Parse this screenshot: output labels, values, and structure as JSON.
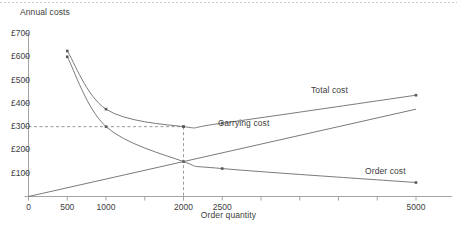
{
  "chart_data": {
    "type": "line",
    "title": "",
    "xlabel": "Order quantity",
    "ylabel": "Annual costs",
    "xlim": [
      0,
      5200
    ],
    "ylim": [
      0,
      700
    ],
    "grid": false,
    "legend_position": "inline-annotations",
    "x_ticks": [
      {
        "value": 0,
        "label": "0"
      },
      {
        "value": 500,
        "label": "500"
      },
      {
        "value": 1000,
        "label": "1000"
      },
      {
        "value": 1500,
        "label": ""
      },
      {
        "value": 2000,
        "label": "2000"
      },
      {
        "value": 2500,
        "label": "2500"
      },
      {
        "value": 3000,
        "label": ""
      },
      {
        "value": 3500,
        "label": ""
      },
      {
        "value": 4000,
        "label": ""
      },
      {
        "value": 4500,
        "label": ""
      },
      {
        "value": 5000,
        "label": "5000"
      }
    ],
    "y_ticks": [
      {
        "value": 100,
        "label": "£100"
      },
      {
        "value": 200,
        "label": "£200"
      },
      {
        "value": 300,
        "label": "£300"
      },
      {
        "value": 400,
        "label": "£400"
      },
      {
        "value": 500,
        "label": "£500"
      },
      {
        "value": 600,
        "label": "£600"
      },
      {
        "value": 700,
        "label": "£700"
      }
    ],
    "series": [
      {
        "name": "Total cost",
        "label": "Total cost",
        "color": "#6b6b6b",
        "markers": true,
        "x": [
          500,
          1000,
          2000,
          2500,
          5000
        ],
        "values": [
          625,
          375,
          300,
          315,
          435
        ]
      },
      {
        "name": "Order cost",
        "label": "Order cost",
        "color": "#6b6b6b",
        "markers": true,
        "x": [
          500,
          1000,
          2000,
          2500,
          5000
        ],
        "values": [
          600,
          300,
          150,
          120,
          60
        ]
      },
      {
        "name": "Carrying cost",
        "label": "Carrying cost",
        "color": "#6b6b6b",
        "markers": false,
        "x": [
          0,
          2000,
          5000
        ],
        "values": [
          0,
          150,
          375
        ]
      }
    ],
    "annotations": [
      {
        "name": "optimum-marker-horizontal",
        "type": "dashed-line",
        "from": [
          0,
          300
        ],
        "to": [
          2000,
          300
        ]
      },
      {
        "name": "optimum-marker-vertical",
        "type": "dashed-line",
        "from": [
          2000,
          300
        ],
        "to": [
          2000,
          0
        ]
      }
    ],
    "series_label_positions": [
      {
        "label_for": "Total cost",
        "x_px": 311,
        "y_px": 85
      },
      {
        "label_for": "Carrying cost",
        "x_px": 218,
        "y_px": 118
      },
      {
        "label_for": "Order cost",
        "x_px": 365,
        "y_px": 166
      }
    ]
  }
}
